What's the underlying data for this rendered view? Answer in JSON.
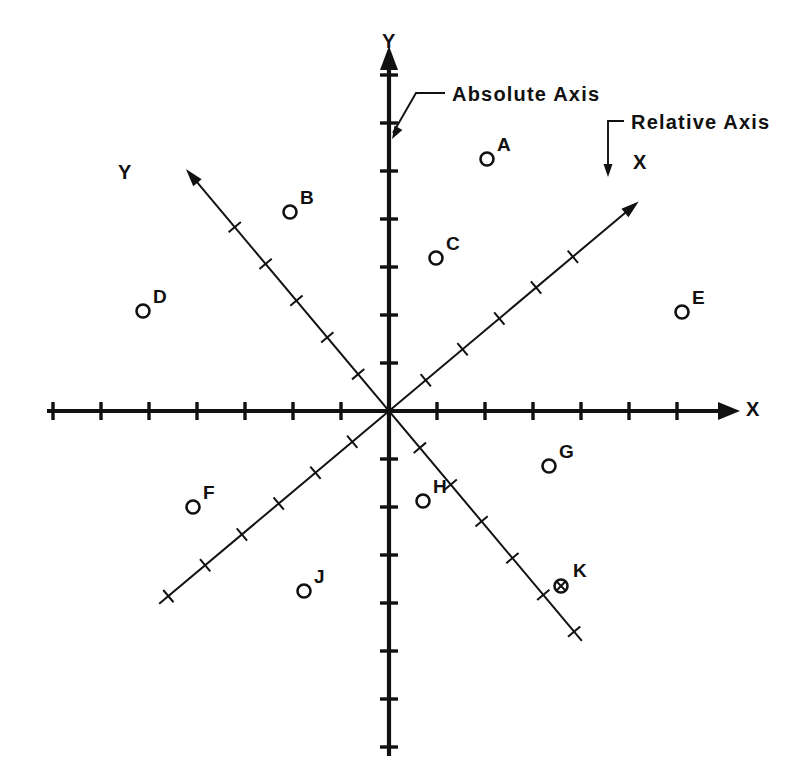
{
  "figure": {
    "background_color": "#ffffff",
    "ink_color": "#111111",
    "width": 799,
    "height": 784,
    "origin": {
      "x": 389,
      "y": 411
    }
  },
  "callouts": [
    {
      "id": "absolute",
      "text": "Absolute Axis",
      "text_x": 452,
      "text_y": 101,
      "leader_points": "445,93 416,93 393,133",
      "arrow_x": 392,
      "arrow_y": 139,
      "arrow_angle": 120
    },
    {
      "id": "relative",
      "text": "Relative Axis",
      "text_x": 631,
      "text_y": 129,
      "leader_points": "624,121 608,121 608,170",
      "arrow_x": 608,
      "arrow_y": 177,
      "arrow_angle": 90
    }
  ],
  "absolute_axes": {
    "name": "Absolute Axis",
    "x_axis": {
      "label": "X",
      "label_x": 746,
      "label_y": 404,
      "start_x": 47,
      "end_x": 726,
      "y": 411,
      "arrow_at": "positive-x"
    },
    "y_axis": {
      "label": "Y",
      "label_x": 382,
      "label_y": 48,
      "x": 389,
      "start_y": 756,
      "end_y": 60,
      "arrow_at": "positive-y"
    },
    "tick_spacing": 48,
    "tick_half_length": 9,
    "x_ticks": [
      -7,
      -6,
      -5,
      -4,
      -3,
      -2,
      -1,
      1,
      2,
      3,
      4,
      5,
      6
    ],
    "y_ticks": [
      -7,
      -6,
      -5,
      -4,
      -3,
      -2,
      -1,
      1,
      2,
      3,
      4,
      5,
      6,
      7
    ]
  },
  "relative_axes": {
    "name": "Relative Axis",
    "rotation_degrees": 40,
    "x_axis": {
      "label": "X",
      "label_x": 633,
      "label_y": 169,
      "arrow_at": "positive-x",
      "positive_end": 310,
      "negative_end": 300
    },
    "y_axis": {
      "label": "Y",
      "label_x": 118,
      "label_y": 179,
      "arrow_at": "positive-y",
      "positive_end": 300,
      "negative_end": 300
    },
    "tick_spacing": 48,
    "tick_half_length": 8,
    "x_ticks": [
      -6,
      -5,
      -4,
      -3,
      -2,
      -1,
      1,
      2,
      3,
      4,
      5
    ],
    "y_ticks": [
      -6,
      -5,
      -4,
      -3,
      -2,
      -1,
      1,
      2,
      3,
      4,
      5
    ]
  },
  "points": [
    {
      "label": "A",
      "cx": 487,
      "cy": 159,
      "lx": 497,
      "ly": 151,
      "marker": "circle"
    },
    {
      "label": "B",
      "cx": 290,
      "cy": 212,
      "lx": 300,
      "ly": 204,
      "marker": "circle"
    },
    {
      "label": "C",
      "cx": 436,
      "cy": 258,
      "lx": 446,
      "ly": 250,
      "marker": "circle"
    },
    {
      "label": "D",
      "cx": 143,
      "cy": 311,
      "lx": 153,
      "ly": 303,
      "marker": "circle"
    },
    {
      "label": "E",
      "cx": 682,
      "cy": 312,
      "lx": 692,
      "ly": 304,
      "marker": "circle"
    },
    {
      "label": "F",
      "cx": 193,
      "cy": 507,
      "lx": 203,
      "ly": 499,
      "marker": "circle"
    },
    {
      "label": "G",
      "cx": 549,
      "cy": 466,
      "lx": 559,
      "ly": 458,
      "marker": "circle"
    },
    {
      "label": "H",
      "cx": 423,
      "cy": 501,
      "lx": 433,
      "ly": 493,
      "marker": "circle"
    },
    {
      "label": "J",
      "cx": 304,
      "cy": 591,
      "lx": 314,
      "ly": 583,
      "marker": "circle"
    },
    {
      "label": "K",
      "cx": 561,
      "cy": 586,
      "lx": 573,
      "ly": 577,
      "marker": "crossed-circle"
    }
  ],
  "chart_data": {
    "type": "scatter",
    "title": "",
    "xlabel": "X",
    "ylabel": "Y",
    "grid": false,
    "legend": "none",
    "coordinate_systems": [
      {
        "name": "Absolute Axis",
        "rotation_degrees": 0,
        "x_label": "X",
        "y_label": "Y",
        "tick_spacing_units": 1
      },
      {
        "name": "Relative Axis",
        "rotation_degrees": 40,
        "x_label": "X",
        "y_label": "Y",
        "tick_spacing_units": 1
      }
    ],
    "xlim": [
      -7.5,
      7
    ],
    "ylim": [
      -7.5,
      7.5
    ],
    "points": [
      {
        "label": "A",
        "x": 2.0,
        "y": 5.2
      },
      {
        "label": "B",
        "x": -2.1,
        "y": 4.1
      },
      {
        "label": "C",
        "x": 1.0,
        "y": 3.2
      },
      {
        "label": "D",
        "x": -5.1,
        "y": 2.1
      },
      {
        "label": "E",
        "x": 6.1,
        "y": 2.1
      },
      {
        "label": "F",
        "x": -4.1,
        "y": -2.0
      },
      {
        "label": "G",
        "x": 3.3,
        "y": -1.1
      },
      {
        "label": "H",
        "x": 0.7,
        "y": -1.9
      },
      {
        "label": "J",
        "x": -1.8,
        "y": -3.7
      },
      {
        "label": "K",
        "x": 3.6,
        "y": -3.6
      }
    ]
  }
}
